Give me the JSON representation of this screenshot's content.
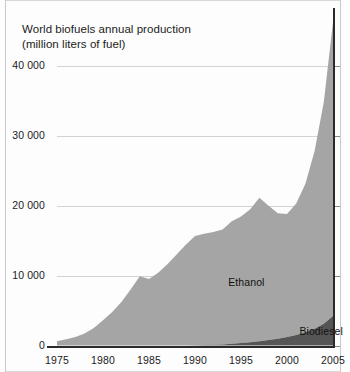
{
  "chart_data": {
    "type": "area",
    "stacked": true,
    "title_line1": "World biofuels annual production",
    "title_line2": "(million liters of fuel)",
    "xlabel": "",
    "ylabel": "million liters of fuel",
    "xlim": [
      1975,
      2005
    ],
    "ylim": [
      0,
      44000
    ],
    "grid": true,
    "y_ticks": [
      0,
      10000,
      20000,
      30000,
      40000
    ],
    "y_tick_labels": [
      "0",
      "10 000",
      "20 000",
      "30 000",
      "40 000"
    ],
    "x_ticks": [
      1975,
      1980,
      1985,
      1990,
      1995,
      2000,
      2005
    ],
    "x_tick_labels": [
      "1975",
      "1980",
      "1985",
      "1990",
      "1995",
      "2000",
      "2005"
    ],
    "legend_position": "inline-annotation",
    "colors": {
      "ethanol": "#a5a5a5",
      "biodiesel": "#555555",
      "gridline": "#d3d3d3",
      "axis": "#2a2a2a",
      "background": "#fdfdfd",
      "text": "#1b1b1b"
    },
    "x": [
      1975,
      1976,
      1977,
      1978,
      1979,
      1980,
      1981,
      1982,
      1983,
      1984,
      1985,
      1986,
      1987,
      1988,
      1989,
      1990,
      1991,
      1992,
      1993,
      1994,
      1995,
      1996,
      1997,
      1998,
      1999,
      2000,
      2001,
      2002,
      2003,
      2004,
      2005
    ],
    "series": [
      {
        "name": "Ethanol",
        "label": "Ethanol",
        "color": "#a5a5a5",
        "values": [
          600,
          900,
          1200,
          1700,
          2500,
          3600,
          4800,
          6200,
          8000,
          9900,
          9500,
          10400,
          11600,
          13000,
          14400,
          15600,
          15900,
          16100,
          16400,
          17500,
          18100,
          19000,
          20500,
          19200,
          17900,
          17600,
          18800,
          21200,
          25400,
          31700,
          42000
        ]
      },
      {
        "name": "Biodiesel",
        "label": "Biodiesel",
        "color": "#555555",
        "values": [
          0,
          0,
          0,
          0,
          0,
          0,
          0,
          0,
          0,
          0,
          0,
          0,
          0,
          0,
          0,
          30,
          60,
          100,
          160,
          240,
          340,
          460,
          600,
          780,
          980,
          1200,
          1500,
          1900,
          2400,
          3100,
          4200
        ]
      }
    ],
    "annotations": [
      {
        "text": "Ethanol",
        "x": 1996,
        "y": 9000
      },
      {
        "text": "Biodiesel",
        "x": 2002,
        "y": 2000
      }
    ]
  }
}
